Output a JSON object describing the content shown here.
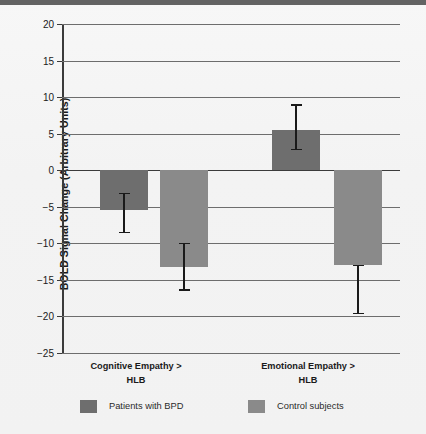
{
  "chart_data": {
    "type": "bar",
    "title": "",
    "xlabel": "",
    "ylabel": "BOLD Signal Change (Arbitrary Units)",
    "categories": [
      "Cognitive Empathy > HLB",
      "Emotional Empathy > HLB"
    ],
    "category_lines": [
      [
        "Cognitive Empathy >",
        "HLB"
      ],
      [
        "Emotional Empathy >",
        "HLB"
      ]
    ],
    "ylim": [
      -25,
      20
    ],
    "yticks": [
      20,
      15,
      10,
      5,
      0,
      -5,
      -10,
      -15,
      -20,
      -25
    ],
    "ytick_labels": [
      "20",
      "15",
      "10",
      "5",
      "0",
      "−5",
      "−10",
      "−15",
      "−20",
      "−25"
    ],
    "grid": true,
    "legend_position": "bottom",
    "series": [
      {
        "name": "Patients with BPD",
        "color": "#6e6e6e",
        "values": [
          -5.5,
          5.5
        ],
        "errors_low": [
          -8.5,
          2.8
        ],
        "errors_high": [
          -3.2,
          8.9
        ]
      },
      {
        "name": "Control subjects",
        "color": "#8a8a8a",
        "values": [
          -13.3,
          -13.0
        ],
        "errors_low": [
          -16.4,
          -19.6
        ],
        "errors_high": [
          -10.0,
          -13.0
        ]
      }
    ]
  },
  "axis": {
    "ylabel": "BOLD Signal Change (Arbitrary Units)",
    "tick_20": "20",
    "tick_15": "15",
    "tick_10": "10",
    "tick_5": "5",
    "tick_0": "0",
    "tick_m5": "−5",
    "tick_m10": "−10",
    "tick_m15": "−15",
    "tick_m20": "−20",
    "tick_m25": "−25"
  },
  "categories": {
    "cat1_line1": "Cognitive Empathy >",
    "cat1_line2": "HLB",
    "cat2_line1": "Emotional Empathy >",
    "cat2_line2": "HLB"
  },
  "legend": {
    "item1_label": "Patients with BPD",
    "item1_color": "#6e6e6e",
    "item2_label": "Control subjects",
    "item2_color": "#8a8a8a"
  }
}
